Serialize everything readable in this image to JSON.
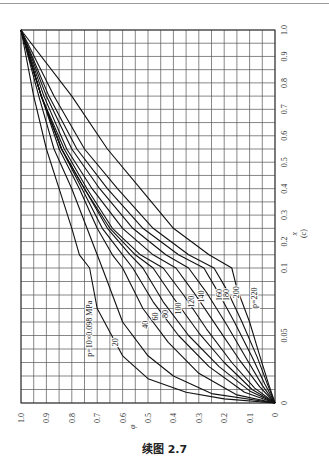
{
  "caption": "续图 2.7",
  "chart_data": {
    "type": "line",
    "orientation": "rotated 90° counter-clockwise on page",
    "panel_label": "(c)",
    "xlabel": "φ",
    "ylabel": "x",
    "x_axis": {
      "name": "φ",
      "range": [
        1.0,
        0
      ],
      "ticks": [
        "1.0",
        "0.9",
        "0.8",
        "0.7",
        "0.6",
        "0.5",
        "0.4",
        "0.3",
        "0.2",
        "0.1",
        "0"
      ]
    },
    "y_axis": {
      "name": "x",
      "range": [
        0,
        1.0
      ],
      "scale": "linear 0.1–1.0, expanded 0–0.1",
      "ticks": [
        "1.0",
        "0.9",
        "0.8",
        "0.7",
        "0.6",
        "0.5",
        "0.4",
        "0.3",
        "0.2",
        "0.1",
        "0.05",
        "0"
      ]
    },
    "grid": true,
    "legend_position": "inline labels on curves",
    "series": [
      {
        "name": "p=10×0.098 MPa",
        "label": "p=10×0.098 MPa",
        "points": [
          [
            1,
            1
          ],
          [
            0.95,
            0.75
          ],
          [
            0.9,
            0.55
          ],
          [
            0.85,
            0.4
          ],
          [
            0.8,
            0.25
          ],
          [
            0.77,
            0.15
          ],
          [
            0.73,
            0.1
          ],
          [
            0.7,
            0.07
          ],
          [
            0.6,
            0.035
          ],
          [
            0.5,
            0.018
          ],
          [
            0.35,
            0.008
          ],
          [
            0.2,
            0.003
          ],
          [
            0,
            0
          ]
        ]
      },
      {
        "name": "20",
        "label": "20",
        "points": [
          [
            1,
            1
          ],
          [
            0.93,
            0.75
          ],
          [
            0.87,
            0.55
          ],
          [
            0.8,
            0.4
          ],
          [
            0.74,
            0.25
          ],
          [
            0.7,
            0.15
          ],
          [
            0.68,
            0.1
          ],
          [
            0.6,
            0.06
          ],
          [
            0.5,
            0.035
          ],
          [
            0.4,
            0.02
          ],
          [
            0.25,
            0.007
          ],
          [
            0,
            0
          ]
        ]
      },
      {
        "name": "40",
        "label": "40",
        "points": [
          [
            1,
            1
          ],
          [
            0.92,
            0.75
          ],
          [
            0.85,
            0.55
          ],
          [
            0.77,
            0.4
          ],
          [
            0.7,
            0.25
          ],
          [
            0.64,
            0.15
          ],
          [
            0.6,
            0.1
          ],
          [
            0.52,
            0.07
          ],
          [
            0.42,
            0.045
          ],
          [
            0.3,
            0.022
          ],
          [
            0.15,
            0.006
          ],
          [
            0,
            0
          ]
        ]
      },
      {
        "name": "60",
        "label": "60",
        "points": [
          [
            1,
            1
          ],
          [
            0.92,
            0.75
          ],
          [
            0.84,
            0.55
          ],
          [
            0.76,
            0.4
          ],
          [
            0.68,
            0.25
          ],
          [
            0.6,
            0.15
          ],
          [
            0.56,
            0.1
          ],
          [
            0.48,
            0.075
          ],
          [
            0.38,
            0.05
          ],
          [
            0.26,
            0.027
          ],
          [
            0.12,
            0.008
          ],
          [
            0,
            0
          ]
        ]
      },
      {
        "name": "80",
        "label": "80",
        "points": [
          [
            1,
            1
          ],
          [
            0.92,
            0.75
          ],
          [
            0.84,
            0.55
          ],
          [
            0.75,
            0.4
          ],
          [
            0.66,
            0.25
          ],
          [
            0.57,
            0.15
          ],
          [
            0.52,
            0.1
          ],
          [
            0.44,
            0.075
          ],
          [
            0.34,
            0.05
          ],
          [
            0.22,
            0.027
          ],
          [
            0.1,
            0.009
          ],
          [
            0,
            0
          ]
        ]
      },
      {
        "name": "100",
        "label": "100",
        "points": [
          [
            1,
            1
          ],
          [
            0.92,
            0.75
          ],
          [
            0.84,
            0.55
          ],
          [
            0.75,
            0.4
          ],
          [
            0.65,
            0.25
          ],
          [
            0.55,
            0.15
          ],
          [
            0.48,
            0.1
          ],
          [
            0.4,
            0.078
          ],
          [
            0.3,
            0.052
          ],
          [
            0.2,
            0.03
          ],
          [
            0.09,
            0.01
          ],
          [
            0,
            0
          ]
        ]
      },
      {
        "name": "120",
        "label": "120",
        "points": [
          [
            1,
            1
          ],
          [
            0.92,
            0.75
          ],
          [
            0.83,
            0.55
          ],
          [
            0.74,
            0.4
          ],
          [
            0.64,
            0.25
          ],
          [
            0.53,
            0.15
          ],
          [
            0.44,
            0.1
          ],
          [
            0.36,
            0.08
          ],
          [
            0.27,
            0.055
          ],
          [
            0.17,
            0.03
          ],
          [
            0.08,
            0.011
          ],
          [
            0,
            0
          ]
        ]
      },
      {
        "name": "140",
        "label": "140",
        "points": [
          [
            1,
            1
          ],
          [
            0.91,
            0.75
          ],
          [
            0.82,
            0.55
          ],
          [
            0.72,
            0.4
          ],
          [
            0.6,
            0.25
          ],
          [
            0.48,
            0.15
          ],
          [
            0.39,
            0.1
          ],
          [
            0.32,
            0.082
          ],
          [
            0.23,
            0.057
          ],
          [
            0.14,
            0.032
          ],
          [
            0.06,
            0.012
          ],
          [
            0,
            0
          ]
        ]
      },
      {
        "name": "160",
        "label": "160",
        "points": [
          [
            1,
            1
          ],
          [
            0.9,
            0.75
          ],
          [
            0.8,
            0.55
          ],
          [
            0.69,
            0.4
          ],
          [
            0.56,
            0.25
          ],
          [
            0.43,
            0.15
          ],
          [
            0.34,
            0.1
          ],
          [
            0.27,
            0.082
          ],
          [
            0.19,
            0.058
          ],
          [
            0.11,
            0.032
          ],
          [
            0.05,
            0.013
          ],
          [
            0,
            0
          ]
        ]
      },
      {
        "name": "180",
        "label": "180",
        "points": [
          [
            1,
            1
          ],
          [
            0.89,
            0.75
          ],
          [
            0.78,
            0.55
          ],
          [
            0.66,
            0.4
          ],
          [
            0.52,
            0.25
          ],
          [
            0.38,
            0.15
          ],
          [
            0.28,
            0.1
          ],
          [
            0.23,
            0.084
          ],
          [
            0.16,
            0.06
          ],
          [
            0.09,
            0.034
          ],
          [
            0.04,
            0.014
          ],
          [
            0,
            0
          ]
        ]
      },
      {
        "name": "200",
        "label": "200",
        "points": [
          [
            1,
            1
          ],
          [
            0.87,
            0.75
          ],
          [
            0.75,
            0.55
          ],
          [
            0.62,
            0.4
          ],
          [
            0.48,
            0.25
          ],
          [
            0.34,
            0.15
          ],
          [
            0.24,
            0.1
          ],
          [
            0.19,
            0.084
          ],
          [
            0.13,
            0.06
          ],
          [
            0.07,
            0.034
          ],
          [
            0.03,
            0.014
          ],
          [
            0,
            0
          ]
        ]
      },
      {
        "name": "p=220",
        "label": "p=220",
        "points": [
          [
            1,
            1
          ],
          [
            0.8,
            0.75
          ],
          [
            0.66,
            0.55
          ],
          [
            0.53,
            0.4
          ],
          [
            0.4,
            0.25
          ],
          [
            0.26,
            0.15
          ],
          [
            0.17,
            0.1
          ],
          [
            0.15,
            0.085
          ],
          [
            0.1,
            0.06
          ],
          [
            0.06,
            0.035
          ],
          [
            0.025,
            0.014
          ],
          [
            0,
            0
          ]
        ]
      }
    ]
  },
  "axis_labels": {
    "bottom": [
      "1.0",
      "0.9",
      "0.8",
      "0.7",
      "0.6",
      "0.5",
      "0.4",
      "0.3",
      "0.2",
      "0.1",
      "0"
    ],
    "right": [
      "1.0",
      "0.9",
      "0.8",
      "0.7",
      "0.6",
      "0.5",
      "0.4",
      "0.3",
      "0.2",
      "0.1",
      "0.05",
      "0"
    ],
    "bottom_title": "φ",
    "right_title": "x",
    "panel": "(c)"
  }
}
